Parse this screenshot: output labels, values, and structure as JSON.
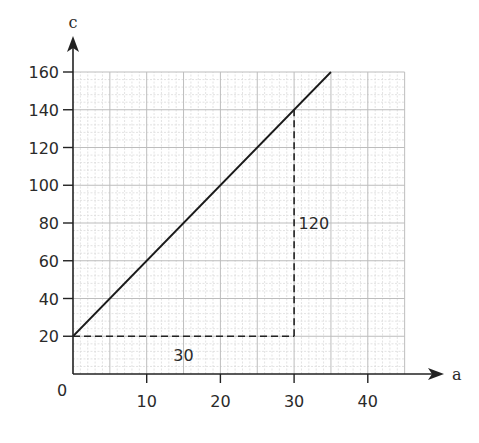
{
  "chart_data": {
    "type": "line",
    "title": "",
    "xlabel": "a",
    "ylabel": "c",
    "origin_label": "0",
    "xlim": [
      0,
      45
    ],
    "ylim": [
      0,
      160
    ],
    "x_ticks": [
      10,
      20,
      30,
      40
    ],
    "x_tick_labels": [
      "10",
      "20",
      "30",
      "40"
    ],
    "y_ticks": [
      20,
      40,
      60,
      80,
      100,
      120,
      140,
      160
    ],
    "y_tick_labels": [
      "20",
      "40",
      "60",
      "80",
      "100",
      "120",
      "140",
      "160"
    ],
    "grid": true,
    "legend": null,
    "series": [
      {
        "name": "c vs a",
        "x": [
          0,
          35
        ],
        "y": [
          20,
          160
        ],
        "style": "solid"
      }
    ],
    "annotations": [
      {
        "type": "dashed-horizontal",
        "from": [
          0,
          20
        ],
        "to": [
          30,
          20
        ],
        "label": "30",
        "label_pos": [
          15,
          10
        ]
      },
      {
        "type": "dashed-vertical",
        "from": [
          30,
          20
        ],
        "to": [
          30,
          140
        ],
        "label": "120",
        "label_pos": [
          30.6,
          80
        ]
      }
    ]
  }
}
